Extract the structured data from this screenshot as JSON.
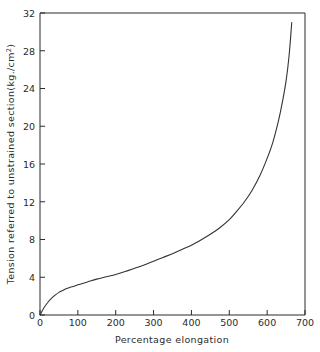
{
  "chart_data": {
    "type": "line",
    "title": "",
    "xlabel": "Percentage elongation",
    "ylabel": "Tension referred to unstrained section (kg./cm²)",
    "ylabel_main": "Tension referred to unstrained section",
    "ylabel_units_prefix": "(kg./cm",
    "ylabel_units_sup": "2",
    "ylabel_units_suffix": ")",
    "xlim": [
      0,
      700
    ],
    "ylim": [
      0,
      32
    ],
    "xticks": [
      0,
      100,
      200,
      300,
      400,
      500,
      600,
      700
    ],
    "yticks": [
      0,
      4,
      8,
      12,
      16,
      20,
      24,
      28,
      32
    ],
    "xtick_labels": [
      "0",
      "100",
      "200",
      "300",
      "400",
      "500",
      "600",
      "700"
    ],
    "ytick_labels": [
      "0",
      "4",
      "8",
      "12",
      "16",
      "20",
      "24",
      "28",
      "32"
    ],
    "grid": false,
    "legend": false,
    "legend_position": "none",
    "line_color": "#333333",
    "axis_color": "#2b2b2b",
    "background_color": "#ffffff",
    "series": [
      {
        "name": "Tension vs elongation",
        "x": [
          0,
          10,
          20,
          30,
          40,
          50,
          60,
          70,
          80,
          90,
          100,
          125,
          150,
          175,
          200,
          225,
          250,
          275,
          300,
          325,
          350,
          375,
          400,
          425,
          450,
          475,
          500,
          520,
          540,
          560,
          580,
          600,
          615,
          630,
          640,
          650,
          658,
          665
        ],
        "y": [
          0,
          0.75,
          1.3,
          1.75,
          2.1,
          2.4,
          2.6,
          2.8,
          2.95,
          3.05,
          3.2,
          3.5,
          3.8,
          4.05,
          4.3,
          4.6,
          4.95,
          5.3,
          5.7,
          6.1,
          6.5,
          6.95,
          7.4,
          7.95,
          8.55,
          9.25,
          10.1,
          11.0,
          12.0,
          13.2,
          14.7,
          16.6,
          18.3,
          20.6,
          22.5,
          24.8,
          27.5,
          31.0
        ]
      }
    ],
    "annotations": []
  },
  "figure": {
    "caption": "",
    "frame": "plot-frame"
  }
}
